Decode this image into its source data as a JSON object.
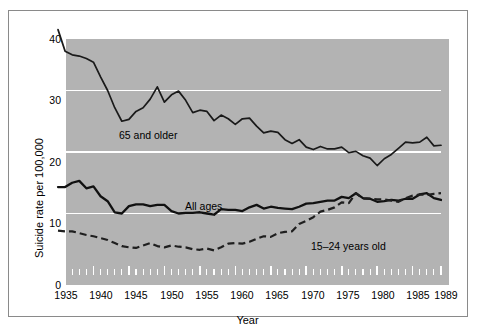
{
  "figure": {
    "plot_bg": "#b3b3b3",
    "grid_color": "#ffffff",
    "line_color": "#1a1a1a"
  },
  "chart_data": {
    "type": "line",
    "title": "",
    "xlabel": "Year",
    "ylabel": "Suicide rate per 100,000",
    "xlim": [
      1935,
      1989
    ],
    "ylim": [
      0,
      40
    ],
    "ytick_labels": [
      "0",
      "10",
      "20",
      "30",
      "40"
    ],
    "yticks": [
      0,
      10,
      20,
      30,
      40
    ],
    "xtick_labels": [
      "1935",
      "1940",
      "1945",
      "1950",
      "1955",
      "1960",
      "1965",
      "1970",
      "1975",
      "1980",
      "1985",
      "1989"
    ],
    "xticks": [
      1935,
      1940,
      1945,
      1950,
      1955,
      1960,
      1965,
      1970,
      1975,
      1980,
      1985,
      1989
    ],
    "minor_xticks_every": 1,
    "grid": "horizontal-white-at-10-20-30",
    "legend_position": "inline-annotations",
    "x": [
      1935,
      1936,
      1937,
      1938,
      1939,
      1940,
      1941,
      1942,
      1943,
      1944,
      1945,
      1946,
      1947,
      1948,
      1949,
      1950,
      1951,
      1952,
      1953,
      1954,
      1955,
      1956,
      1957,
      1958,
      1959,
      1960,
      1961,
      1962,
      1963,
      1964,
      1965,
      1966,
      1967,
      1968,
      1969,
      1970,
      1971,
      1972,
      1973,
      1974,
      1975,
      1976,
      1977,
      1978,
      1979,
      1980,
      1981,
      1982,
      1983,
      1984,
      1985,
      1986,
      1987,
      1988,
      1989
    ],
    "series": [
      {
        "name": "65 and older",
        "style": "solid",
        "label": "65 and older",
        "values": [
          39.9,
          36.4,
          35.8,
          35.6,
          35.2,
          34.6,
          32.2,
          30.0,
          27.2,
          25.0,
          25.3,
          26.6,
          27.2,
          28.6,
          30.6,
          28.1,
          29.3,
          29.9,
          28.4,
          26.4,
          26.8,
          26.6,
          25.1,
          26.0,
          25.4,
          24.5,
          25.4,
          25.5,
          24.2,
          23.1,
          23.4,
          23.2,
          22.0,
          21.4,
          22.0,
          20.8,
          20.4,
          20.9,
          20.5,
          20.5,
          20.8,
          19.9,
          20.1,
          19.4,
          19.0,
          17.8,
          18.9,
          19.6,
          20.6,
          21.6,
          21.5,
          21.6,
          22.4,
          21.0,
          21.1
        ]
      },
      {
        "name": "All ages",
        "style": "solid-bold",
        "label": "All ages",
        "values": [
          14.3,
          14.3,
          15.0,
          15.3,
          14.1,
          14.4,
          12.8,
          12.0,
          10.2,
          10.0,
          11.2,
          11.5,
          11.5,
          11.2,
          11.4,
          11.4,
          10.4,
          10.0,
          10.1,
          10.1,
          10.2,
          10.0,
          9.8,
          10.7,
          10.6,
          10.6,
          10.4,
          11.0,
          11.4,
          10.8,
          11.1,
          10.9,
          10.8,
          10.7,
          11.1,
          11.6,
          11.7,
          11.9,
          12.1,
          12.1,
          12.7,
          12.5,
          13.3,
          12.5,
          12.4,
          11.9,
          12.0,
          12.2,
          12.1,
          12.4,
          12.4,
          13.1,
          13.3,
          12.5,
          12.2
        ]
      },
      {
        "name": "15-24 years old",
        "style": "dashed",
        "label": "15–24 years old",
        "values": [
          7.2,
          7.1,
          7.1,
          6.8,
          6.5,
          6.3,
          6.0,
          5.7,
          5.2,
          4.7,
          4.5,
          4.4,
          4.8,
          5.2,
          4.7,
          4.5,
          4.8,
          4.6,
          4.5,
          4.2,
          4.1,
          4.3,
          4.0,
          4.5,
          5.1,
          5.2,
          5.1,
          5.4,
          5.9,
          6.3,
          6.2,
          6.8,
          7.0,
          7.1,
          8.3,
          8.8,
          9.4,
          10.3,
          10.6,
          11.0,
          11.8,
          11.7,
          13.3,
          12.4,
          12.4,
          12.3,
          12.3,
          12.1,
          11.9,
          12.5,
          12.9,
          13.1,
          13.0,
          13.2,
          13.3
        ]
      }
    ],
    "annotations": [
      {
        "text": "65 and older",
        "x": 1942,
        "y": 24.2
      },
      {
        "text": "All ages",
        "x": 1958,
        "y": 14.5
      },
      {
        "text": "15–24 years old",
        "x": 1973,
        "y": 7.5
      }
    ]
  }
}
